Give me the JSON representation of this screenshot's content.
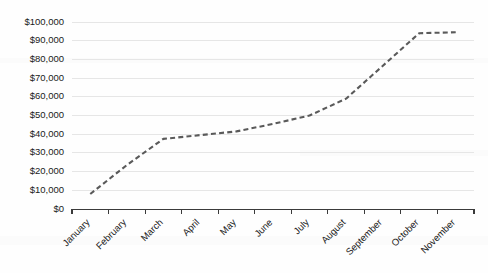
{
  "chart_data": {
    "type": "line",
    "title": "",
    "xlabel": "",
    "ylabel": "",
    "categories": [
      "January",
      "February",
      "March",
      "April",
      "May",
      "June",
      "July",
      "August",
      "September",
      "October",
      "November"
    ],
    "values": [
      8000,
      23500,
      37500,
      39500,
      41500,
      45500,
      50000,
      59000,
      76500,
      94000,
      94500
    ],
    "series": [
      {
        "name": "Cumulative Amount",
        "values": [
          8000,
          23500,
          37500,
          39500,
          41500,
          45500,
          50000,
          59000,
          76500,
          94000,
          94500
        ]
      }
    ],
    "ylim": [
      0,
      100000
    ],
    "ytick_values": [
      0,
      10000,
      20000,
      30000,
      40000,
      50000,
      60000,
      70000,
      80000,
      90000,
      100000
    ],
    "ytick_labels": [
      "$0",
      "$10,000",
      "$20,000",
      "$30,000",
      "$40,000",
      "$50,000",
      "$60,000",
      "$70,000",
      "$80,000",
      "$90,000",
      "$100,000"
    ],
    "grid": true,
    "grid_axis": "y",
    "legend": false,
    "legend_position": "none",
    "line_style": "dashed",
    "line_color": "#5a5a5a",
    "gridline_color": "#e6e6e6",
    "axis_color": "#3a3a3a",
    "background_color": "#fefefe",
    "xtick_label_rotation": -45,
    "markers": false
  },
  "figure": {
    "plot_left": 72,
    "plot_right": 474,
    "plot_top": 22,
    "plot_bottom": 209
  }
}
